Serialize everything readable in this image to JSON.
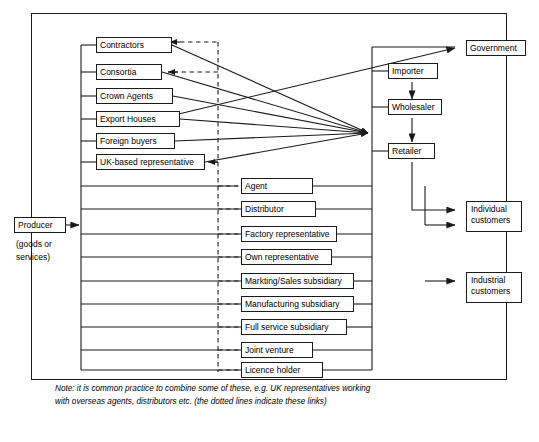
{
  "diagram": {
    "producer": {
      "label": "Producer",
      "sublabel_line1": "(goods or",
      "sublabel_line2": "services)"
    },
    "intermediaries_upper": [
      {
        "label": "Contractors"
      },
      {
        "label": "Consortia"
      },
      {
        "label": "Crown Agents"
      },
      {
        "label": "Export Houses"
      },
      {
        "label": "Foreign buyers"
      },
      {
        "label": "UK-based representative"
      }
    ],
    "intermediaries_lower": [
      {
        "label": "Agent"
      },
      {
        "label": "Distributor"
      },
      {
        "label": "Factory representative"
      },
      {
        "label": "Own representative"
      },
      {
        "label": "Markting/Sales subsidiary"
      },
      {
        "label": "Manufacturing subsidiary"
      },
      {
        "label": "Full service subsidiary"
      },
      {
        "label": "Joint venture"
      },
      {
        "label": "Licence holder"
      }
    ],
    "channel_chain": [
      {
        "label": "Importer"
      },
      {
        "label": "Wholesaler"
      },
      {
        "label": "Retailer"
      }
    ],
    "destinations": [
      {
        "label": "Government"
      },
      {
        "label_line1": "Individual",
        "label_line2": "customers"
      },
      {
        "label_line1": "Industrial",
        "label_line2": "customers"
      }
    ],
    "note": "Note: it is common practice to combine some of these, e.g. UK representatives working with overseas agents, distributors etc. (the dotted lines indicate these links)",
    "colors": {
      "line": "#1a1a1a",
      "box_border": "#1a1a1a",
      "background": "#ffffff",
      "text": "#000000"
    }
  }
}
